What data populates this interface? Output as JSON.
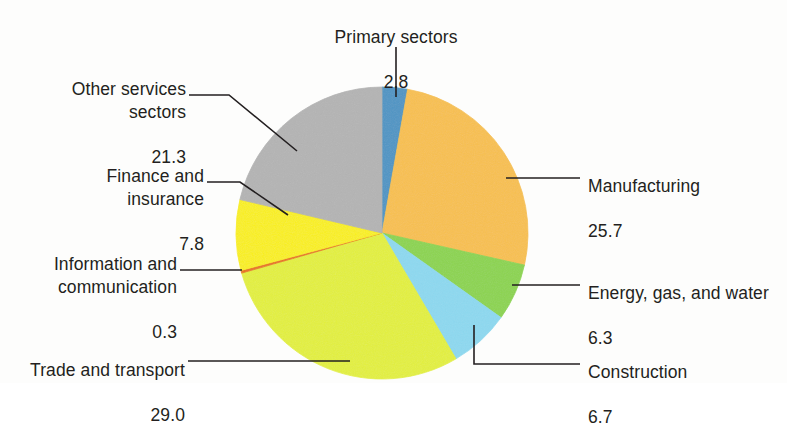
{
  "chart_data": {
    "type": "pie",
    "title": "",
    "subtitle": "",
    "xlabel": "",
    "ylabel": "",
    "units": "percent",
    "legend_position": "callout-labels",
    "grid": false,
    "start_angle_deg": 0,
    "direction": "clockwise",
    "total": 99.9,
    "categories": [
      "Primary sectors",
      "Manufacturing",
      "Energy, gas, and water",
      "Construction",
      "Trade and transport",
      "Information and communication",
      "Finance and insurance",
      "Other services sectors"
    ],
    "values": [
      2.8,
      25.7,
      6.3,
      6.7,
      29.0,
      0.3,
      7.8,
      21.3
    ],
    "value_labels": [
      "2.8",
      "25.7",
      "6.3",
      "6.7",
      "29.0",
      "0.3",
      "7.8",
      "21.3"
    ],
    "colors": [
      "#4E95C4",
      "#F8C04F",
      "#8CD44F",
      "#8DD9F0",
      "#E3F03C",
      "#E8730F",
      "#FAF017",
      "#B4B4B4"
    ],
    "slices": [
      {
        "label": "Primary sectors",
        "value": 2.8,
        "value_label": "2.8",
        "color": "#4E95C4"
      },
      {
        "label": "Manufacturing",
        "value": 25.7,
        "value_label": "25.7",
        "color": "#F8C04F"
      },
      {
        "label": "Energy, gas, and water",
        "value": 6.3,
        "value_label": "6.3",
        "color": "#8CD44F"
      },
      {
        "label": "Construction",
        "value": 6.7,
        "value_label": "6.7",
        "color": "#8DD9F0"
      },
      {
        "label": "Trade and transport",
        "value": 29.0,
        "value_label": "29.0",
        "color": "#E3F03C"
      },
      {
        "label": "Information and communication",
        "value": 0.3,
        "value_label": "0.3",
        "color": "#E8730F"
      },
      {
        "label": "Finance and insurance",
        "value": 7.8,
        "value_label": "7.8",
        "color": "#FAF017"
      },
      {
        "label": "Other services sectors",
        "value": 21.3,
        "value_label": "21.3",
        "color": "#B4B4B4"
      }
    ]
  },
  "callouts": {
    "primary_sectors": {
      "name": "Primary sectors",
      "value": "2.8"
    },
    "manufacturing": {
      "name": "Manufacturing",
      "value": "25.7"
    },
    "energy": {
      "name": "Energy, gas, and water",
      "value": "6.3"
    },
    "construction": {
      "name": "Construction",
      "value": "6.7"
    },
    "trade": {
      "name": "Trade and transport",
      "value": "29.0"
    },
    "information": {
      "name": "Information and\ncommunication",
      "value": "0.3"
    },
    "finance": {
      "name": "Finance and\ninsurance",
      "value": "7.8"
    },
    "other_services": {
      "name": "Other services\nsectors",
      "value": "21.3"
    }
  }
}
